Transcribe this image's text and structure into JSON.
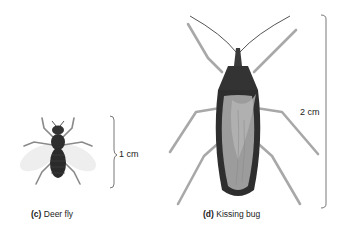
{
  "figure": {
    "panels": [
      {
        "id": "c",
        "letter": "(c)",
        "name": "Deer fly",
        "scale_label": "1 cm",
        "colors": {
          "body": "#2b2b2b",
          "wings": "#e6e6e6",
          "legs": "#8a8a8a"
        }
      },
      {
        "id": "d",
        "letter": "(d)",
        "name": "Kissing bug",
        "scale_label": "2 cm",
        "colors": {
          "body": "#2e2e2e",
          "wings": "#9a9a9a",
          "legs": "#a8a8a8"
        }
      }
    ],
    "bracket_color": "#555555"
  }
}
